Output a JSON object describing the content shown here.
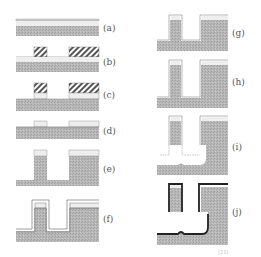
{
  "figure": {
    "type": "process-flow",
    "steps": [
      {
        "id": "a",
        "label": "(a)"
      },
      {
        "id": "b",
        "label": "(b)"
      },
      {
        "id": "c",
        "label": "(c)"
      },
      {
        "id": "d",
        "label": "(d)"
      },
      {
        "id": "e",
        "label": "(e)"
      },
      {
        "id": "f",
        "label": "(f)"
      },
      {
        "id": "g",
        "label": "(g)"
      },
      {
        "id": "h",
        "label": "(h)"
      },
      {
        "id": "i",
        "label": "(i)"
      },
      {
        "id": "j",
        "label": "(j)"
      }
    ],
    "caption_ref": "[21]"
  },
  "colors": {
    "substrate": "#b4b4b4",
    "film": "#ececec",
    "hatch": "#555555",
    "outline": "#888888",
    "metal": "#222222"
  }
}
